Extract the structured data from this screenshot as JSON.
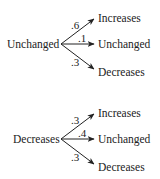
{
  "trees": [
    {
      "source": "Unchanged",
      "branches": [
        {
          "probability": ".6",
          "outcome": "Increases"
        },
        {
          "probability": ".1",
          "outcome": "Unchanged"
        },
        {
          "probability": ".3",
          "outcome": "Decreases"
        }
      ]
    },
    {
      "source": "Decreases",
      "branches": [
        {
          "probability": ".3",
          "outcome": "Increases"
        },
        {
          "probability": ".4",
          "outcome": "Unchanged"
        },
        {
          "probability": ".3",
          "outcome": "Decreases"
        }
      ]
    }
  ]
}
